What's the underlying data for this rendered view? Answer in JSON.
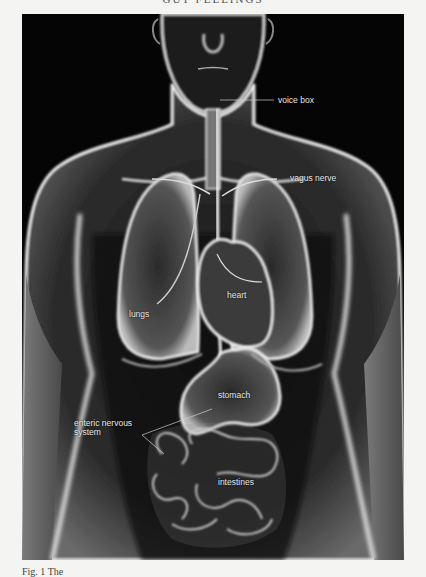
{
  "page": {
    "running_head": "GUT FEELINGS",
    "caption": "Fig. 1 The"
  },
  "figure": {
    "labels": {
      "voice_box": "voice box",
      "vagus_nerve": "vagus nerve",
      "heart": "heart",
      "lungs": "lungs",
      "stomach": "stomach",
      "enteric_line1": "enteric nervous",
      "enteric_line2": "system",
      "intestines": "intestines"
    },
    "colors": {
      "background": "#050505",
      "glow": "#f0f0f0",
      "label_text": "#e8e8e8"
    }
  }
}
